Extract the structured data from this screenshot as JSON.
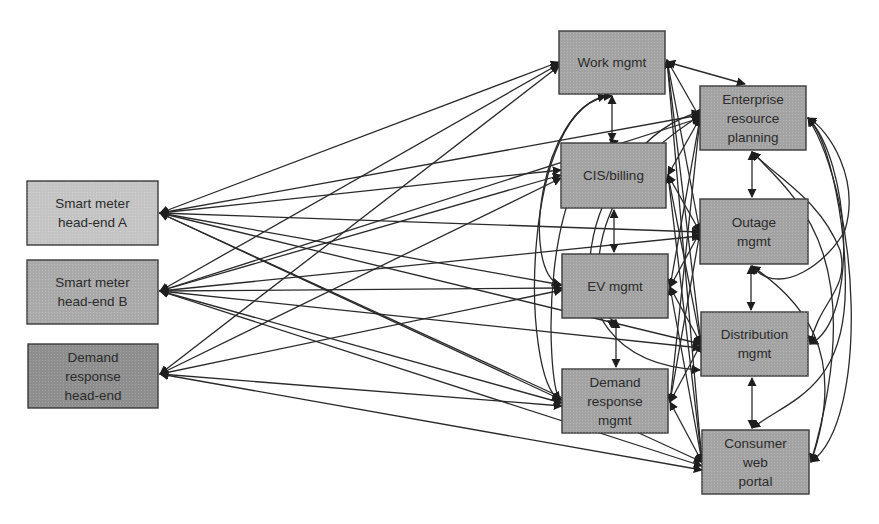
{
  "diagram": {
    "colors": {
      "background": "#ffffff",
      "edge": "#2a2a2a",
      "border": "#3a3a3a",
      "text": "#2b2b2b"
    },
    "nodes": [
      {
        "id": "sm_a",
        "label": "Smart meter\nhead-end A",
        "x": 27,
        "y": 181,
        "w": 131,
        "h": 64,
        "fill": "#c4c4c4"
      },
      {
        "id": "sm_b",
        "label": "Smart meter\nhead-end B",
        "x": 27,
        "y": 260,
        "w": 131,
        "h": 64,
        "fill": "#a9a9a9"
      },
      {
        "id": "dr_he",
        "label": "Demand\nresponse\nhead-end",
        "x": 28,
        "y": 344,
        "w": 130,
        "h": 64,
        "fill": "#8e8e8e"
      },
      {
        "id": "work",
        "label": "Work mgmt",
        "x": 559,
        "y": 31,
        "w": 106,
        "h": 63,
        "fill": "#a3a3a3"
      },
      {
        "id": "cis",
        "label": "CIS/billing",
        "x": 561,
        "y": 143,
        "w": 105,
        "h": 65,
        "fill": "#a3a3a3"
      },
      {
        "id": "ev",
        "label": "EV mgmt",
        "x": 562,
        "y": 254,
        "w": 106,
        "h": 64,
        "fill": "#a3a3a3"
      },
      {
        "id": "dr_mgmt",
        "label": "Demand\nresponse\nmgmt",
        "x": 562,
        "y": 369,
        "w": 106,
        "h": 64,
        "fill": "#a3a3a3"
      },
      {
        "id": "erp",
        "label": "Enterprise\nresource\nplanning",
        "x": 700,
        "y": 86,
        "w": 106,
        "h": 64,
        "fill": "#a3a3a3"
      },
      {
        "id": "outage",
        "label": "Outage\nmgmt",
        "x": 700,
        "y": 199,
        "w": 108,
        "h": 65,
        "fill": "#a3a3a3"
      },
      {
        "id": "dist",
        "label": "Distribution\nmgmt",
        "x": 701,
        "y": 312,
        "w": 107,
        "h": 64,
        "fill": "#a3a3a3"
      },
      {
        "id": "portal",
        "label": "Consumer\nweb\nportal",
        "x": 702,
        "y": 430,
        "w": 107,
        "h": 64,
        "fill": "#a3a3a3"
      }
    ],
    "edges": [
      {
        "from": [
          160,
          213
        ],
        "to": [
          559,
          62
        ]
      },
      {
        "from": [
          160,
          213
        ],
        "to": [
          561,
          170
        ]
      },
      {
        "from": [
          160,
          213
        ],
        "to": [
          562,
          285
        ]
      },
      {
        "from": [
          160,
          213
        ],
        "to": [
          562,
          400
        ]
      },
      {
        "from": [
          160,
          213
        ],
        "to": [
          700,
          115
        ]
      },
      {
        "from": [
          160,
          213
        ],
        "to": [
          700,
          232
        ]
      },
      {
        "from": [
          160,
          213
        ],
        "to": [
          701,
          344
        ]
      },
      {
        "from": [
          160,
          213
        ],
        "to": [
          702,
          462
        ]
      },
      {
        "from": [
          160,
          291
        ],
        "to": [
          559,
          64
        ]
      },
      {
        "from": [
          160,
          291
        ],
        "to": [
          561,
          175
        ]
      },
      {
        "from": [
          160,
          291
        ],
        "to": [
          562,
          288
        ]
      },
      {
        "from": [
          160,
          291
        ],
        "to": [
          562,
          403
        ]
      },
      {
        "from": [
          160,
          291
        ],
        "to": [
          700,
          118
        ]
      },
      {
        "from": [
          160,
          291
        ],
        "to": [
          700,
          236
        ]
      },
      {
        "from": [
          160,
          291
        ],
        "to": [
          701,
          348
        ]
      },
      {
        "from": [
          160,
          291
        ],
        "to": [
          702,
          466
        ]
      },
      {
        "from": [
          160,
          374
        ],
        "to": [
          559,
          66
        ]
      },
      {
        "from": [
          160,
          374
        ],
        "to": [
          561,
          178
        ]
      },
      {
        "from": [
          160,
          374
        ],
        "to": [
          562,
          290
        ]
      },
      {
        "from": [
          160,
          374
        ],
        "to": [
          562,
          406
        ]
      },
      {
        "from": [
          160,
          374
        ],
        "to": [
          702,
          470
        ]
      },
      {
        "from": [
          612,
          96
        ],
        "to": [
          612,
          141
        ]
      },
      {
        "from": [
          614,
          210
        ],
        "to": [
          614,
          252
        ]
      },
      {
        "from": [
          616,
          320
        ],
        "to": [
          616,
          367
        ]
      },
      {
        "from": [
          752,
          152
        ],
        "to": [
          752,
          197
        ]
      },
      {
        "from": [
          751,
          266
        ],
        "to": [
          751,
          310
        ]
      },
      {
        "from": [
          752,
          378
        ],
        "to": [
          752,
          428
        ]
      },
      {
        "from": [
          667,
          60
        ],
        "to": [
          700,
          118
        ]
      },
      {
        "from": [
          667,
          60
        ],
        "to": [
          700,
          232
        ]
      },
      {
        "from": [
          667,
          60
        ],
        "to": [
          701,
          344
        ]
      },
      {
        "from": [
          667,
          60
        ],
        "to": [
          702,
          462
        ]
      },
      {
        "from": [
          667,
          62
        ],
        "to": [
          745,
          84
        ]
      },
      {
        "from": [
          668,
          175
        ],
        "to": [
          700,
          118
        ]
      },
      {
        "from": [
          668,
          175
        ],
        "to": [
          700,
          232
        ]
      },
      {
        "from": [
          668,
          175
        ],
        "to": [
          701,
          344
        ]
      },
      {
        "from": [
          668,
          175
        ],
        "to": [
          702,
          462
        ]
      },
      {
        "from": [
          670,
          287
        ],
        "to": [
          700,
          118
        ]
      },
      {
        "from": [
          670,
          287
        ],
        "to": [
          700,
          232
        ]
      },
      {
        "from": [
          670,
          287
        ],
        "to": [
          701,
          344
        ]
      },
      {
        "from": [
          670,
          287
        ],
        "to": [
          702,
          462
        ]
      },
      {
        "from": [
          670,
          402
        ],
        "to": [
          700,
          118
        ]
      },
      {
        "from": [
          670,
          402
        ],
        "to": [
          700,
          232
        ]
      },
      {
        "from": [
          670,
          402
        ],
        "to": [
          701,
          344
        ]
      },
      {
        "from": [
          670,
          402
        ],
        "to": [
          702,
          462
        ]
      }
    ],
    "curves": [
      {
        "d": "M 612 96 C 520 100, 520 380, 560 400"
      },
      {
        "d": "M 606 96 C 540 110, 520 270, 560 285"
      },
      {
        "d": "M 618 141 C 540 160, 545 380, 560 400"
      },
      {
        "d": "M 700 112 C 590 140, 520 360, 700 370"
      },
      {
        "d": "M 700 116 C 560 200, 600 330, 616 320"
      },
      {
        "d": "M 808 118 C 850 160, 860 320, 810 344"
      },
      {
        "d": "M 808 118 C 860 200, 870 420, 811 462"
      },
      {
        "d": "M 752 152 C 780 180, 820 200, 840 250 C 850 290, 820 300, 810 344"
      },
      {
        "d": "M 752 152 C 800 200, 870 260, 811 462"
      },
      {
        "d": "M 752 266 C 780 300, 830 260, 845 230 C 860 180, 830 130, 808 118"
      },
      {
        "d": "M 752 266 C 800 300, 850 350, 811 462"
      },
      {
        "d": "M 752 428 C 790 400, 840 390, 845 300 C 848 230, 830 140, 808 118"
      }
    ]
  }
}
